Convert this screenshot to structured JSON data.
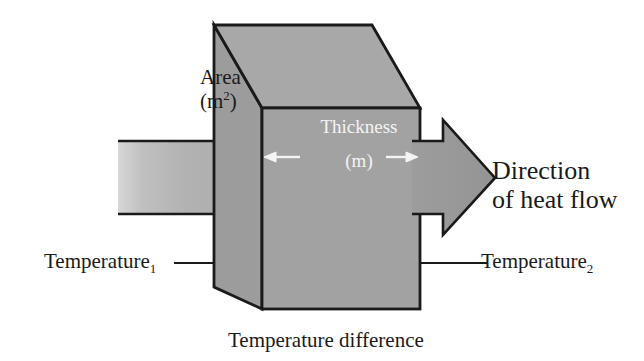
{
  "figure": {
    "background_color": "#ffffff",
    "stroke_color": "#1a1a1a",
    "labels": {
      "area": "Area",
      "area_unit_open": "(m",
      "area_unit_exponent": "2",
      "area_unit_close": ")",
      "thickness": "Thickness",
      "thickness_unit": "(m)",
      "direction_line1": "Direction",
      "direction_line2": "of heat flow",
      "temperature_1_base": "Temperature",
      "temperature_1_sub": "1",
      "temperature_2_base": "Temperature",
      "temperature_2_sub": "2",
      "temperature_difference": "Temperature difference"
    },
    "colors": {
      "block_front_face": "#a2a2a2",
      "block_top_face": "#a8a8a8",
      "block_left_face": "#9c9c9c",
      "arrow_in": "#b0b0b0",
      "arrow_out": "#9a9a9a",
      "outline": "#1a1a1a",
      "white_dimension_arrow": "#f4f4f4",
      "text": "#1a1a1a",
      "text_on_block": "#f4f4f4"
    },
    "icons": {
      "heat_in_arrow": "arrow-right-icon",
      "heat_out_arrow": "arrow-right-icon",
      "thickness_left_arrow": "arrow-left-icon",
      "thickness_right_arrow": "arrow-right-icon"
    }
  }
}
